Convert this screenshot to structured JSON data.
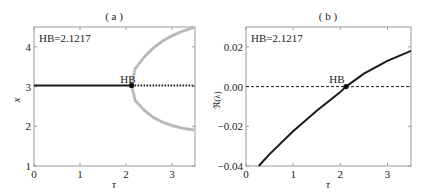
{
  "chart_data": [
    {
      "type": "line",
      "panel": "(a)",
      "title": "( a )",
      "xlabel": "τ",
      "ylabel": "x",
      "xlim": [
        0,
        3.5
      ],
      "ylim": [
        1,
        4.5
      ],
      "xticks": [
        "0",
        "1",
        "2",
        "3"
      ],
      "yticks": [
        "1",
        "2",
        "3",
        "4"
      ],
      "annotation": "HB=2.1217",
      "hb_label": "HB",
      "hb_point": {
        "x": 2.1217,
        "y": 3.03
      },
      "series": [
        {
          "name": "stable equilibrium",
          "style": "solid",
          "color": "#1a1a1a",
          "x": [
            0,
            2.1217
          ],
          "y": [
            3.03,
            3.03
          ]
        },
        {
          "name": "unstable equilibrium",
          "style": "dotted",
          "color": "#1a1a1a",
          "x": [
            2.1217,
            3.5
          ],
          "y": [
            3.03,
            3.03
          ]
        },
        {
          "name": "limit cycle max",
          "style": "dots",
          "color": "#b8b8b8",
          "x": [
            2.1217,
            2.2,
            2.4,
            2.6,
            2.8,
            3.0,
            3.2,
            3.5
          ],
          "y": [
            3.03,
            3.45,
            3.75,
            3.98,
            4.15,
            4.28,
            4.38,
            4.5
          ]
        },
        {
          "name": "limit cycle min",
          "style": "dots",
          "color": "#b8b8b8",
          "x": [
            2.1217,
            2.2,
            2.4,
            2.6,
            2.8,
            3.0,
            3.2,
            3.5
          ],
          "y": [
            3.03,
            2.65,
            2.4,
            2.22,
            2.1,
            2.02,
            1.96,
            1.9
          ]
        }
      ]
    },
    {
      "type": "line",
      "panel": "(b)",
      "title": "( b )",
      "xlabel": "τ",
      "ylabel": "ℜ(λ)",
      "xlim": [
        0,
        3.5
      ],
      "ylim": [
        -0.04,
        0.03
      ],
      "xticks": [
        "0",
        "1",
        "2",
        "3"
      ],
      "yticks": [
        "−0.04",
        "−0.02",
        "0.00",
        "0.02"
      ],
      "annotation": "HB=2.1217",
      "hb_label": "HB",
      "hb_point": {
        "x": 2.1217,
        "y": 0.0
      },
      "series": [
        {
          "name": "Re(lambda)",
          "style": "solid",
          "color": "#1a1a1a",
          "x": [
            0.27,
            0.5,
            1.0,
            1.5,
            2.0,
            2.1217,
            2.5,
            3.0,
            3.5
          ],
          "y": [
            -0.04,
            -0.034,
            -0.0225,
            -0.0122,
            -0.0028,
            0.0,
            0.0065,
            0.013,
            0.018
          ]
        },
        {
          "name": "zero line",
          "style": "dashed",
          "color": "#1a1a1a",
          "x": [
            0,
            3.5
          ],
          "y": [
            0,
            0
          ]
        }
      ]
    }
  ]
}
